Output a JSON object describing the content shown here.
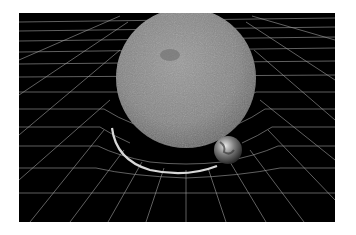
{
  "illustration": {
    "subject": "spacetime-curvature",
    "objects": [
      "sun",
      "earth",
      "orbit",
      "spacetime-grid"
    ],
    "colors": {
      "background": "#000000",
      "grid": "#bdbdbd",
      "sun": "#8a8a8a",
      "orbit": "#d8d8d8",
      "page": "#ffffff"
    }
  }
}
